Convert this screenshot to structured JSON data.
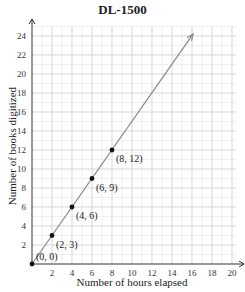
{
  "chart_data": {
    "type": "line",
    "title": "DL-1500",
    "xlabel": "Number of hours elapsed",
    "ylabel": "Number of books digitized",
    "xlim": [
      0,
      21
    ],
    "ylim": [
      0,
      25
    ],
    "x_ticks": [
      2,
      4,
      6,
      8,
      10,
      12,
      14,
      16,
      18,
      20
    ],
    "y_ticks": [
      2,
      4,
      6,
      8,
      10,
      12,
      14,
      16,
      18,
      20,
      22,
      24
    ],
    "grid": true,
    "series": [
      {
        "name": "DL-1500",
        "x": [
          0,
          2,
          4,
          6,
          8
        ],
        "y": [
          0,
          3,
          6,
          9,
          12
        ],
        "labels": [
          "(0, 0)",
          "(2, 3)",
          "(4, 6)",
          "(6, 9)",
          "(8, 12)"
        ],
        "line_extends_to": [
          16.1,
          24.2
        ],
        "color": "#888888"
      }
    ]
  }
}
